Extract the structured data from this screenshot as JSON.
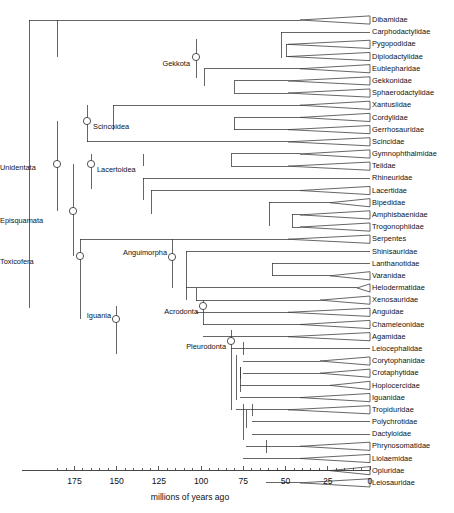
{
  "figure": {
    "type": "phylogenetic-tree",
    "orientation": "left-to-right-timescale",
    "background_color": "#ffffff",
    "line_color": "#333333",
    "node_marker": "open-circle"
  },
  "axis": {
    "title": "millions of years ago",
    "direction": "reversed",
    "min": 0,
    "max": 185,
    "tick_labels": [
      "175",
      "150",
      "125",
      "100",
      "75",
      "50",
      "25",
      "0"
    ],
    "tick_values": [
      175,
      150,
      125,
      100,
      75,
      50,
      25,
      0
    ],
    "minor_tick_interval": 5,
    "x_at_zero_px": 370,
    "px_per_myr": 1.6885
  },
  "tips": [
    {
      "label": "Dibamidae",
      "row": 0,
      "stem_x": 29,
      "triangle": true,
      "tri_start_x": 300
    },
    {
      "label": "Carphodactylidae",
      "row": 1,
      "stem_x": 281,
      "triangle": false,
      "tri_start_x": 370
    },
    {
      "label": "Pygopodidae",
      "row": 2,
      "stem_x": 286,
      "triangle": true,
      "tri_start_x": 288
    },
    {
      "label": "Diplodactylidae",
      "row": 3,
      "stem_x": 286,
      "triangle": true,
      "tri_start_x": 288
    },
    {
      "label": "Eublepharidae",
      "row": 4,
      "stem_x": 204,
      "triangle": true,
      "tri_start_x": 300
    },
    {
      "label": "Gekkonidae",
      "row": 5,
      "stem_x": 234,
      "triangle": true,
      "tri_start_x": 288
    },
    {
      "label": "Sphaerodactylidae",
      "row": 6,
      "stem_x": 234,
      "triangle": true,
      "tri_start_x": 288
    },
    {
      "label": "Xantusiidae",
      "row": 7,
      "stem_x": 113,
      "triangle": true,
      "tri_start_x": 300
    },
    {
      "label": "Cordylidae",
      "row": 8,
      "stem_x": 234,
      "triangle": true,
      "tri_start_x": 300
    },
    {
      "label": "Gerrhosauridae",
      "row": 9,
      "stem_x": 234,
      "triangle": true,
      "tri_start_x": 288
    },
    {
      "label": "Scincidae",
      "row": 10,
      "stem_x": 87,
      "triangle": true,
      "tri_start_x": 288
    },
    {
      "label": "Gymnophthalmidae",
      "row": 11,
      "stem_x": 231,
      "triangle": true,
      "tri_start_x": 300
    },
    {
      "label": "Teiidae",
      "row": 12,
      "stem_x": 231,
      "triangle": true,
      "tri_start_x": 288
    },
    {
      "label": "Rhineuridae",
      "row": 13,
      "stem_x": 143,
      "triangle": false,
      "tri_start_x": 370
    },
    {
      "label": "Lacertidae",
      "row": 14,
      "stem_x": 151,
      "triangle": true,
      "tri_start_x": 300
    },
    {
      "label": "Bipedidae",
      "row": 15,
      "stem_x": 269,
      "triangle": true,
      "tri_start_x": 330
    },
    {
      "label": "Amphisbaenidae",
      "row": 16,
      "stem_x": 292,
      "triangle": true,
      "tri_start_x": 300
    },
    {
      "label": "Trogonophiidae",
      "row": 17,
      "stem_x": 292,
      "triangle": true,
      "tri_start_x": 300
    },
    {
      "label": "Serpentes",
      "row": 18,
      "stem_x": 80,
      "triangle": true,
      "tri_start_x": 288
    },
    {
      "label": "Shinisauridae",
      "row": 19,
      "stem_x": 186,
      "triangle": false,
      "tri_start_x": 370
    },
    {
      "label": "Lanthanotidae",
      "row": 20,
      "stem_x": 272,
      "triangle": false,
      "tri_start_x": 370
    },
    {
      "label": "Varanidae",
      "row": 21,
      "stem_x": 272,
      "triangle": true,
      "tri_start_x": 330
    },
    {
      "label": "Helodermatidae",
      "row": 22,
      "stem_x": 186,
      "triangle": true,
      "tri_start_x": 357
    },
    {
      "label": "Xenosauridae",
      "row": 23,
      "stem_x": 196,
      "triangle": true,
      "tri_start_x": 320
    },
    {
      "label": "Anguidae",
      "row": 24,
      "stem_x": 196,
      "triangle": true,
      "tri_start_x": 288
    },
    {
      "label": "Chameleonidae",
      "row": 25,
      "stem_x": 203,
      "triangle": true,
      "tri_start_x": 300
    },
    {
      "label": "Agamidae",
      "row": 26,
      "stem_x": 203,
      "triangle": true,
      "tri_start_x": 288
    },
    {
      "label": "Leiocephalidae",
      "row": 27,
      "stem_x": 231,
      "triangle": false,
      "tri_start_x": 370
    },
    {
      "label": "Corytophanidae",
      "row": 28,
      "stem_x": 243,
      "triangle": true,
      "tri_start_x": 320
    },
    {
      "label": "Crotaphytidae",
      "row": 29,
      "stem_x": 243,
      "triangle": true,
      "tri_start_x": 320
    },
    {
      "label": "Hoplocercidae",
      "row": 30,
      "stem_x": 240,
      "triangle": true,
      "tri_start_x": 330
    },
    {
      "label": "Iguanidae",
      "row": 31,
      "stem_x": 240,
      "triangle": true,
      "tri_start_x": 300
    },
    {
      "label": "Tropiduridae",
      "row": 32,
      "stem_x": 236,
      "triangle": true,
      "tri_start_x": 288
    },
    {
      "label": "Polychrotidae",
      "row": 33,
      "stem_x": 252,
      "triangle": false,
      "tri_start_x": 370
    },
    {
      "label": "Dactyloidae",
      "row": 34,
      "stem_x": 252,
      "triangle": false,
      "tri_start_x": 370
    },
    {
      "label": "Phrynosomatidae",
      "row": 35,
      "stem_x": 246,
      "triangle": true,
      "tri_start_x": 300
    },
    {
      "label": "Liolaemidae",
      "row": 36,
      "stem_x": 243,
      "triangle": true,
      "tri_start_x": 300
    },
    {
      "label": "Opluridae",
      "row": 37,
      "stem_x": 266,
      "triangle": true,
      "tri_start_x": 330
    },
    {
      "label": "Leiosauridae",
      "row": 38,
      "stem_x": 266,
      "triangle": true,
      "tri_start_x": 300
    }
  ],
  "clades": [
    {
      "label": "Unidentata",
      "node_x": 57,
      "node_y": 164,
      "label_x": 18,
      "label_y": 168,
      "anchor": "end"
    },
    {
      "label": "Episquamata",
      "node_x": 73,
      "node_y": 211,
      "label_x": 16,
      "label_y": 221,
      "anchor": "end"
    },
    {
      "label": "Toxicofera",
      "node_x": 80,
      "node_y": 256,
      "label_x": 30,
      "label_y": 262,
      "anchor": "end"
    },
    {
      "label": "Gekkota",
      "node_x": 196,
      "node_y": 57,
      "label_x": 190,
      "label_y": 64,
      "anchor": "end"
    },
    {
      "label": "Scincoidea",
      "node_x": 87,
      "node_y": 121,
      "label_x": 93,
      "label_y": 127,
      "anchor": "start"
    },
    {
      "label": "Lacertoidea",
      "node_x": 91,
      "node_y": 164,
      "label_x": 97,
      "label_y": 170,
      "anchor": "start"
    },
    {
      "label": "Anguimorpha",
      "node_x": 172,
      "node_y": 257,
      "label_x": 167,
      "label_y": 253,
      "anchor": "end"
    },
    {
      "label": "Iguania",
      "node_x": 116,
      "node_y": 319,
      "label_x": 111,
      "label_y": 316,
      "anchor": "end"
    },
    {
      "label": "Acrodonta",
      "node_x": 203,
      "node_y": 306,
      "label_x": 198,
      "label_y": 312,
      "anchor": "end"
    },
    {
      "label": "Pleurodonta",
      "node_x": 231,
      "node_y": 341,
      "label_x": 226,
      "label_y": 347,
      "anchor": "end"
    }
  ],
  "internal_nodes": [
    {
      "name": "squamata-root",
      "x": 29,
      "y_top": 20,
      "y_bot": 308
    },
    {
      "name": "gekkota-stem",
      "x": 57,
      "y_top": 20,
      "y_bot": 57
    },
    {
      "name": "gekkota-split",
      "x": 196,
      "y_top": 39,
      "y_bot": 78
    },
    {
      "name": "diplodactyloid",
      "x": 281,
      "y_top": 32,
      "y_bot": 58
    },
    {
      "name": "pygo-diplo",
      "x": 286,
      "y_top": 44,
      "y_bot": 57
    },
    {
      "name": "gekkonoid",
      "x": 204,
      "y_top": 69,
      "y_bot": 86
    },
    {
      "name": "gekko-sphaero",
      "x": 234,
      "y_top": 81,
      "y_bot": 93
    },
    {
      "name": "unidentata",
      "x": 57,
      "y_top": 121,
      "y_bot": 211
    },
    {
      "name": "scincoidea",
      "x": 87,
      "y_top": 105,
      "y_bot": 142
    },
    {
      "name": "cordyloid-clade",
      "x": 113,
      "y_top": 105,
      "y_bot": 130
    },
    {
      "name": "cordy-gerrho",
      "x": 234,
      "y_top": 118,
      "y_bot": 130
    },
    {
      "name": "episquamata",
      "x": 73,
      "y_top": 164,
      "y_bot": 256
    },
    {
      "name": "lacertoidea",
      "x": 91,
      "y_top": 154,
      "y_bot": 189
    },
    {
      "name": "teioidea",
      "x": 143,
      "y_top": 154,
      "y_bot": 166
    },
    {
      "name": "gymno-teiid",
      "x": 231,
      "y_top": 154,
      "y_bot": 166
    },
    {
      "name": "lacertibaenia",
      "x": 143,
      "y_top": 178,
      "y_bot": 200
    },
    {
      "name": "amphisbaenia",
      "x": 151,
      "y_top": 190,
      "y_bot": 214
    },
    {
      "name": "amphis-clade",
      "x": 269,
      "y_top": 202,
      "y_bot": 226
    },
    {
      "name": "amph-trogono",
      "x": 292,
      "y_top": 214,
      "y_bot": 227
    },
    {
      "name": "toxicofera",
      "x": 80,
      "y_top": 239,
      "y_bot": 319
    },
    {
      "name": "anguimorpha",
      "x": 172,
      "y_top": 239,
      "y_bot": 288
    },
    {
      "name": "varanoidea",
      "x": 186,
      "y_top": 251,
      "y_bot": 276
    },
    {
      "name": "lanth-varan",
      "x": 272,
      "y_top": 263,
      "y_bot": 276
    },
    {
      "name": "anguioidea",
      "x": 186,
      "y_top": 276,
      "y_bot": 300
    },
    {
      "name": "xeno-anguid",
      "x": 196,
      "y_top": 288,
      "y_bot": 301
    },
    {
      "name": "iguania",
      "x": 116,
      "y_top": 306,
      "y_bot": 354
    },
    {
      "name": "acrodonta",
      "x": 203,
      "y_top": 300,
      "y_bot": 325
    },
    {
      "name": "pleurodonta",
      "x": 231,
      "y_top": 330,
      "y_bot": 410
    },
    {
      "name": "corytoph-crotaph",
      "x": 243,
      "y_top": 342,
      "y_bot": 355
    },
    {
      "name": "pleuro-b",
      "x": 236,
      "y_top": 355,
      "y_bot": 400
    },
    {
      "name": "hoplo-iguanid",
      "x": 240,
      "y_top": 367,
      "y_bot": 379
    },
    {
      "name": "pleuro-c",
      "x": 240,
      "y_top": 367,
      "y_bot": 392
    },
    {
      "name": "pleuro-d",
      "x": 243,
      "y_top": 404,
      "y_bot": 440
    },
    {
      "name": "anolis-clade",
      "x": 252,
      "y_top": 404,
      "y_bot": 416
    },
    {
      "name": "anolis-phryno",
      "x": 246,
      "y_top": 410,
      "y_bot": 428
    },
    {
      "name": "oplu-leio",
      "x": 266,
      "y_top": 440,
      "y_bot": 453
    }
  ],
  "layout": {
    "first_row_y": 20,
    "row_spacing": 12.18,
    "tip_x": 370,
    "label_x": 372,
    "axis_y": 470,
    "axis_x_start": 22,
    "axis_x_end": 370
  }
}
